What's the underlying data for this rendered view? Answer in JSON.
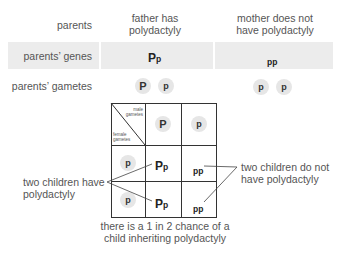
{
  "header": {
    "row_label": "parents",
    "father": [
      "father has",
      "polydactyly"
    ],
    "mother": [
      "mother does not",
      "have polydactyly"
    ]
  },
  "genes_row": {
    "label": "parents’ genes",
    "father_cap": "P",
    "father_low": "p",
    "mother": "pp"
  },
  "gametes_row": {
    "label": "parents’ gametes",
    "father": [
      "P",
      "p"
    ],
    "mother": [
      "p",
      "p"
    ]
  },
  "punnett": {
    "corner_top": [
      "male",
      "gametes"
    ],
    "corner_bottom": [
      "female",
      "gametes"
    ],
    "male_gametes": [
      "P",
      "p"
    ],
    "female_gametes": [
      "p",
      "p"
    ],
    "cells": [
      [
        {
          "cap": "P",
          "low": "p"
        },
        {
          "cap": "",
          "low": "pp"
        }
      ],
      [
        {
          "cap": "P",
          "low": "p"
        },
        {
          "cap": "",
          "low": "pp"
        }
      ]
    ]
  },
  "annotations": {
    "left": [
      "two children have",
      "polydactyly"
    ],
    "right": [
      "two children do not",
      "have polydactyly"
    ],
    "bottom": [
      "there is a 1 in 2 chance of a",
      "child inheriting polydactyly"
    ]
  },
  "colors": {
    "shade": "#ececec",
    "circle": "#e6e6e6",
    "grid_line": "#333333",
    "text": "#555555"
  }
}
